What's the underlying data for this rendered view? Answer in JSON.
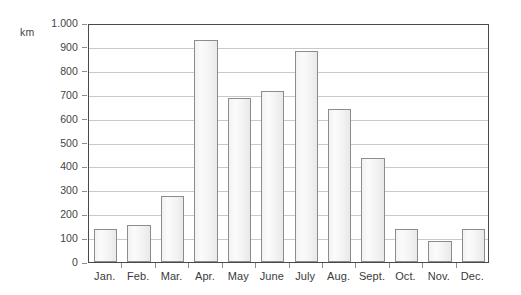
{
  "chart_data": {
    "type": "bar",
    "title": "",
    "subtitle": "",
    "xlabel": "",
    "ylabel": "km",
    "unit_label": "km",
    "categories": [
      "Jan.",
      "Feb.",
      "Mar.",
      "Apr.",
      "May",
      "June",
      "July",
      "Aug.",
      "Sept.",
      "Oct.",
      "Nov.",
      "Dec."
    ],
    "values": [
      140,
      155,
      277,
      930,
      685,
      715,
      885,
      640,
      435,
      140,
      90,
      138
    ],
    "ylim": [
      0,
      1000
    ],
    "y_ticks": [
      0,
      100,
      200,
      300,
      400,
      500,
      600,
      700,
      800,
      900,
      1000
    ],
    "y_tick_labels": [
      "0",
      "100",
      "200",
      "300",
      "400",
      "500",
      "600",
      "700",
      "800",
      "900",
      "1.000"
    ],
    "grid": true,
    "grid_axis": "y",
    "legend": false,
    "legend_position": "none",
    "series": [
      {
        "name": "",
        "values": [
          140,
          155,
          277,
          930,
          685,
          715,
          885,
          640,
          435,
          140,
          90,
          138
        ]
      }
    ]
  },
  "style": {
    "bar_fill": "#f4f4f4",
    "bar_stroke": "#8c8c8c",
    "grid_color": "#c9c9c9",
    "axis_color": "#4a4a4a",
    "text_color": "#3a3a3a",
    "background": "#ffffff"
  }
}
